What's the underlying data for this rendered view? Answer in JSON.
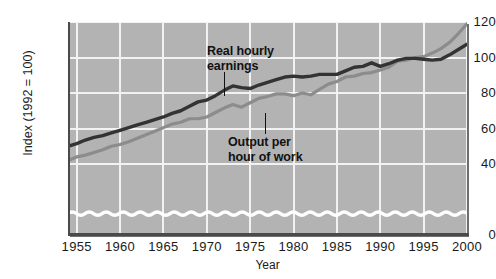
{
  "chart_data": {
    "type": "line",
    "title": "",
    "xlabel": "Year",
    "ylabel": "Index (1992 = 100)",
    "xlim": [
      1954,
      2000
    ],
    "ylim": [
      0,
      120
    ],
    "yticks": [
      0,
      40,
      60,
      80,
      100,
      120
    ],
    "xticks": [
      1955,
      1960,
      1965,
      1970,
      1975,
      1980,
      1985,
      1990,
      1995,
      2000
    ],
    "grid": true,
    "legend_position": "inline-annotations",
    "axis_break": "wavy white band near y = 12 indicating broken y-axis between 0 and 40",
    "annotations": [
      {
        "text": "Real hourly earnings",
        "series": "Real hourly earnings",
        "points_to_year": 1973
      },
      {
        "text": "Output per hour of work",
        "series": "Output per hour of work",
        "points_to_year": 1977
      }
    ],
    "series": [
      {
        "name": "Real hourly earnings",
        "color": "#333333",
        "x": [
          1954,
          1955,
          1956,
          1957,
          1958,
          1959,
          1960,
          1961,
          1962,
          1963,
          1964,
          1965,
          1966,
          1967,
          1968,
          1969,
          1970,
          1971,
          1972,
          1973,
          1974,
          1975,
          1976,
          1977,
          1978,
          1979,
          1980,
          1981,
          1982,
          1983,
          1984,
          1985,
          1986,
          1987,
          1988,
          1989,
          1990,
          1991,
          1992,
          1993,
          1994,
          1995,
          1996,
          1997,
          1998,
          1999,
          2000
        ],
        "values": [
          50,
          51.5,
          53.5,
          55,
          56,
          57.5,
          59,
          60.5,
          62,
          63.5,
          65,
          66.5,
          68.5,
          70,
          72.5,
          75,
          76,
          78.5,
          81.5,
          84,
          83,
          82.5,
          84.5,
          86,
          87.5,
          89,
          89.5,
          89,
          89.5,
          90.5,
          90.5,
          90.5,
          92.5,
          94.5,
          95,
          97,
          95,
          96.5,
          98.5,
          99.5,
          99.5,
          99,
          98.5,
          99,
          101.5,
          104.5,
          107.5
        ]
      },
      {
        "name": "Output per hour of work",
        "color": "#8c8c8c",
        "x": [
          1954,
          1955,
          1956,
          1957,
          1958,
          1959,
          1960,
          1961,
          1962,
          1963,
          1964,
          1965,
          1966,
          1967,
          1968,
          1969,
          1970,
          1971,
          1972,
          1973,
          1974,
          1975,
          1976,
          1977,
          1978,
          1979,
          1980,
          1981,
          1982,
          1983,
          1984,
          1985,
          1986,
          1987,
          1988,
          1989,
          1990,
          1991,
          1992,
          1993,
          1994,
          1995,
          1996,
          1997,
          1998,
          1999,
          2000
        ],
        "values": [
          42,
          44,
          45,
          46.5,
          48,
          50,
          51,
          52.5,
          54.5,
          56.5,
          58.5,
          60.5,
          62.5,
          63.5,
          65.5,
          65.5,
          66.5,
          69,
          71.5,
          73.5,
          72,
          74.5,
          77,
          78,
          79.5,
          79.5,
          78.5,
          80,
          79,
          82,
          85,
          86.5,
          89,
          89.5,
          91,
          91.5,
          93,
          94.5,
          98,
          98.5,
          100,
          100.5,
          102.5,
          105,
          108.5,
          113.5,
          119
        ]
      }
    ]
  },
  "axis": {
    "ylabel": "Index (1992 = 100)",
    "xlabel": "Year",
    "yticks": [
      "0",
      "40",
      "60",
      "80",
      "100",
      "120"
    ],
    "xticks": [
      "1955",
      "1960",
      "1965",
      "1970",
      "1975",
      "1980",
      "1985",
      "1990",
      "1995",
      "2000"
    ]
  },
  "annotations": {
    "earnings_line1": "Real hourly",
    "earnings_line2": "earnings",
    "output_line1": "Output per",
    "output_line2": "hour of work"
  },
  "colors": {
    "plot_background": "#b3b3b3",
    "gridline": "#f2f2f2",
    "axis": "#4a4a4a",
    "series_earnings": "#333333",
    "series_output": "#8c8c8c",
    "break_wave": "#ffffff"
  }
}
